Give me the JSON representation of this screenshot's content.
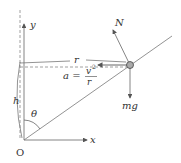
{
  "diagram": {
    "type": "physics-free-body-diagram",
    "labels": {
      "y_axis": "y",
      "x_axis": "x",
      "origin": "O",
      "normal_force": "N",
      "gravity": "mg",
      "radius": "r",
      "height": "h",
      "angle": "θ",
      "accel_lhs": "a =",
      "accel_num": "v",
      "accel_exp": "2",
      "accel_den": "r"
    },
    "colors": {
      "line": "#666666",
      "text": "#333333",
      "ball": "#888888"
    }
  }
}
